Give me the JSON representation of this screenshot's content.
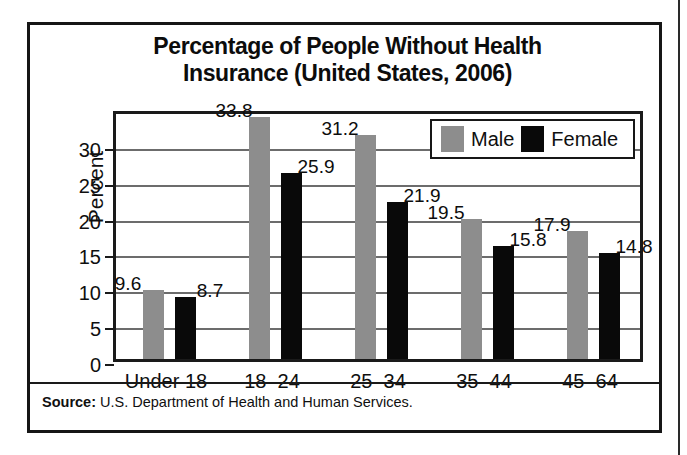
{
  "figure": {
    "title_line1": "Percentage of People Without Health",
    "title_line2": "Insurance (United States, 2006)",
    "source_label": "Source:",
    "source_text": "U.S. Department of Health and Human Services."
  },
  "colors": {
    "male": "#8d8d8d",
    "female": "#090909",
    "frame": "#161616",
    "gridline": "#6c6c6c",
    "background": "#ffffff"
  },
  "chart_data": {
    "type": "bar",
    "title": "Percentage of People Without Health Insurance (United States, 2006)",
    "xlabel": "",
    "ylabel": "Percent",
    "categories": [
      "Under 18",
      "18–24",
      "25–34",
      "35–44",
      "45–64"
    ],
    "series": [
      {
        "name": "Male",
        "color": "#8d8d8d",
        "values": [
          9.6,
          33.8,
          31.2,
          19.5,
          17.9
        ]
      },
      {
        "name": "Female",
        "color": "#090909",
        "values": [
          8.7,
          25.9,
          21.9,
          15.8,
          14.8
        ]
      }
    ],
    "ylim": [
      0,
      35
    ],
    "yticks": [
      0,
      5,
      10,
      15,
      20,
      25,
      30
    ],
    "ytick_labels": [
      "0",
      "5",
      "10",
      "15",
      "20",
      "25",
      "30"
    ],
    "grid": true,
    "grid_axis": "y",
    "legend_position": "top-right",
    "data_labels": true,
    "value_label_format": "one-decimal"
  }
}
